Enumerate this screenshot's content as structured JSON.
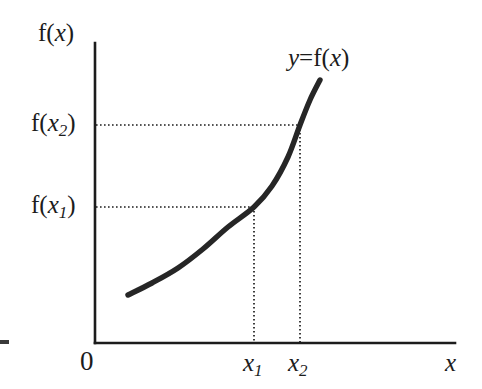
{
  "figure": {
    "background_color": "#ffffff",
    "ink_color": "#1c1c1c",
    "curve_color": "#262626"
  },
  "axes": {
    "y_axis_label": "f(x)",
    "x_axis_label": "x",
    "origin_label": "0"
  },
  "labels": {
    "curve_equation_y": "y",
    "curve_equation_eq": "=",
    "curve_equation_f": "f(",
    "curve_equation_x": "x",
    "curve_equation_close": ")",
    "fx1_f": "f(",
    "fx1_x": "x",
    "fx1_sub": "1",
    "fx1_close": ")",
    "fx2_f": "f(",
    "fx2_x": "x",
    "fx2_sub": "2",
    "fx2_close": ")",
    "x1_tick_var": "x",
    "x1_tick_sub": "1",
    "x2_tick_var": "x",
    "x2_tick_sub": "2",
    "yaxis_f": "f(",
    "yaxis_x": "x",
    "yaxis_close": ")"
  },
  "chart_data": {
    "type": "line",
    "title": "",
    "xlabel": "x",
    "ylabel": "f(x)",
    "grid": false,
    "legend": "none",
    "axis_pixel_frame": {
      "origin_x": 95,
      "origin_y": 343,
      "y_axis_top": 43,
      "x_axis_right": 455
    },
    "series": [
      {
        "name": "y = f(x)",
        "points": [
          [
            128,
            295
          ],
          [
            152,
            283
          ],
          [
            178,
            268
          ],
          [
            203,
            249
          ],
          [
            228,
            227
          ],
          [
            254,
            207
          ],
          [
            272,
            186
          ],
          [
            288,
            157
          ],
          [
            300,
            125
          ],
          [
            310,
            100
          ],
          [
            320,
            80
          ]
        ]
      }
    ],
    "annotations": [
      {
        "name": "x1-guide",
        "x_pixel": 254,
        "y_pixel": 207,
        "x_label": "x1",
        "y_label": "f(x1)",
        "style": "dotted"
      },
      {
        "name": "x2-guide",
        "x_pixel": 300,
        "y_pixel": 125,
        "x_label": "x2",
        "y_label": "f(x2)",
        "style": "dotted"
      },
      {
        "name": "curve-equation",
        "text": "y = f(x)",
        "x_pixel": 288,
        "y_pixel": 62
      }
    ],
    "ordering": "x1 < x2 and f(x1) < f(x2)"
  }
}
